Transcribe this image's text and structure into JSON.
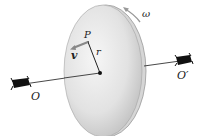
{
  "figure": {
    "labels": {
      "point": "P",
      "radius": "r",
      "velocity": "v",
      "angular_velocity": "ω",
      "axis_left": "O",
      "axis_right": "O′"
    },
    "colors": {
      "disk_fill_light": "#f4f4f4",
      "disk_fill_dark": "#c8c8c8",
      "disk_rim": "#9a9a9a",
      "axle": "#333333",
      "bearing": "#111111",
      "velocity_arrow": "#888888",
      "text": "#222222"
    }
  }
}
